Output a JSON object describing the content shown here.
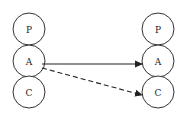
{
  "left_stack": {
    "nodes": [
      {
        "label": "P",
        "cx": 29,
        "cy": 29
      },
      {
        "label": "A",
        "cx": 29,
        "cy": 61
      },
      {
        "label": "C",
        "cx": 29,
        "cy": 92
      }
    ]
  },
  "right_stack": {
    "nodes": [
      {
        "label": "P",
        "cx": 158,
        "cy": 29
      },
      {
        "label": "A",
        "cx": 158,
        "cy": 61
      },
      {
        "label": "C",
        "cx": 158,
        "cy": 92
      }
    ]
  },
  "edges": [
    {
      "from": "left.A",
      "to": "right.A",
      "style": "solid"
    },
    {
      "from": "left.A",
      "to": "right.C",
      "style": "dashed"
    }
  ],
  "colors": {
    "stroke": "#333333",
    "background": "#ffffff"
  }
}
